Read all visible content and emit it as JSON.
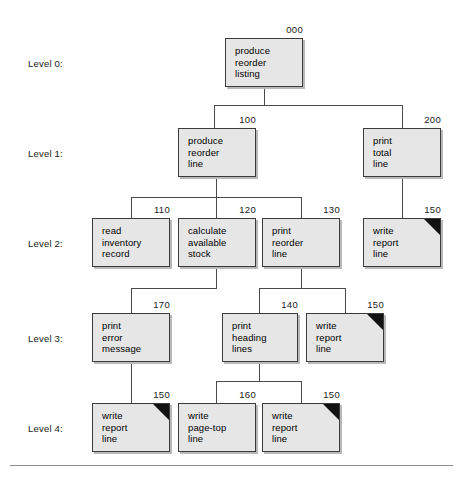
{
  "chart_data": {
    "type": "diagram",
    "level_labels": [
      {
        "text": "Level 0:",
        "x": 28,
        "y": 58
      },
      {
        "text": "Level 1:",
        "x": 28,
        "y": 148
      },
      {
        "text": "Level 2:",
        "x": 28,
        "y": 238
      },
      {
        "text": "Level 3:",
        "x": 28,
        "y": 333
      },
      {
        "text": "Level 4:",
        "x": 28,
        "y": 423
      }
    ],
    "nodes": [
      {
        "id": "n000",
        "num": "000",
        "label": "produce\nreorder\nlisting",
        "x": 225,
        "y": 38,
        "w": 78,
        "h": 49,
        "dup": false,
        "level": 0
      },
      {
        "id": "n100",
        "num": "100",
        "label": "produce\nreorder\nline",
        "x": 178,
        "y": 128,
        "w": 78,
        "h": 49,
        "dup": false,
        "level": 1
      },
      {
        "id": "n200",
        "num": "200",
        "label": "print\ntotal\nline",
        "x": 363,
        "y": 128,
        "w": 78,
        "h": 49,
        "dup": false,
        "level": 1
      },
      {
        "id": "n110",
        "num": "110",
        "label": "read\ninventory\nrecord",
        "x": 92,
        "y": 218,
        "w": 78,
        "h": 49,
        "dup": false,
        "level": 2
      },
      {
        "id": "n120",
        "num": "120",
        "label": "calculate\navailable\nstock",
        "x": 178,
        "y": 218,
        "w": 78,
        "h": 49,
        "dup": false,
        "level": 2
      },
      {
        "id": "n130",
        "num": "130",
        "label": "print\nreorder\nline",
        "x": 262,
        "y": 218,
        "w": 78,
        "h": 49,
        "dup": false,
        "level": 2
      },
      {
        "id": "n150a",
        "num": "150",
        "label": "write\nreport\nline",
        "x": 363,
        "y": 218,
        "w": 78,
        "h": 49,
        "dup": true,
        "level": 2
      },
      {
        "id": "n170",
        "num": "170",
        "label": "print\nerror\nmessage",
        "x": 92,
        "y": 313,
        "w": 78,
        "h": 49,
        "dup": false,
        "level": 3
      },
      {
        "id": "n140",
        "num": "140",
        "label": "print\nheading\nlines",
        "x": 222,
        "y": 313,
        "w": 76,
        "h": 49,
        "dup": false,
        "level": 3
      },
      {
        "id": "n150b",
        "num": "150",
        "label": "write\nreport\nline",
        "x": 306,
        "y": 313,
        "w": 78,
        "h": 49,
        "dup": true,
        "level": 3
      },
      {
        "id": "n150c",
        "num": "150",
        "label": "write\nreport\nline",
        "x": 92,
        "y": 403,
        "w": 78,
        "h": 49,
        "dup": true,
        "level": 4
      },
      {
        "id": "n160",
        "num": "160",
        "label": "write\npage-top\nline",
        "x": 178,
        "y": 403,
        "w": 78,
        "h": 49,
        "dup": false,
        "level": 4
      },
      {
        "id": "n150d",
        "num": "150",
        "label": "write\nreport\nline",
        "x": 262,
        "y": 403,
        "w": 78,
        "h": 49,
        "dup": true,
        "level": 4
      }
    ],
    "edges": [
      {
        "from": "n000",
        "to": "n100"
      },
      {
        "from": "n000",
        "to": "n200"
      },
      {
        "from": "n100",
        "to": "n110"
      },
      {
        "from": "n100",
        "to": "n120"
      },
      {
        "from": "n100",
        "to": "n130"
      },
      {
        "from": "n200",
        "to": "n150a"
      },
      {
        "from": "n120",
        "to": "n170"
      },
      {
        "from": "n130",
        "to": "n140"
      },
      {
        "from": "n130",
        "to": "n150b"
      },
      {
        "from": "n170",
        "to": "n150c"
      },
      {
        "from": "n140",
        "to": "n160"
      },
      {
        "from": "n140",
        "to": "n150d"
      }
    ],
    "segments": [
      {
        "o": "v",
        "x": 264,
        "y": 87,
        "len": 18
      },
      {
        "o": "h",
        "x": 214,
        "y": 105,
        "len": 189
      },
      {
        "o": "v",
        "x": 214,
        "y": 105,
        "len": 23
      },
      {
        "o": "v",
        "x": 402,
        "y": 105,
        "len": 23
      },
      {
        "o": "v",
        "x": 216,
        "y": 177,
        "len": 20
      },
      {
        "o": "h",
        "x": 131,
        "y": 197,
        "len": 171
      },
      {
        "o": "v",
        "x": 131,
        "y": 197,
        "len": 21
      },
      {
        "o": "v",
        "x": 216,
        "y": 197,
        "len": 21
      },
      {
        "o": "v",
        "x": 301,
        "y": 197,
        "len": 21
      },
      {
        "o": "v",
        "x": 402,
        "y": 177,
        "len": 41
      },
      {
        "o": "v",
        "x": 216,
        "y": 267,
        "len": 21
      },
      {
        "o": "h",
        "x": 131,
        "y": 288,
        "len": 86
      },
      {
        "o": "v",
        "x": 131,
        "y": 288,
        "len": 25
      },
      {
        "o": "v",
        "x": 301,
        "y": 267,
        "len": 21
      },
      {
        "o": "h",
        "x": 259,
        "y": 288,
        "len": 87
      },
      {
        "o": "v",
        "x": 259,
        "y": 288,
        "len": 25
      },
      {
        "o": "v",
        "x": 345,
        "y": 288,
        "len": 25
      },
      {
        "o": "v",
        "x": 131,
        "y": 362,
        "len": 41
      },
      {
        "o": "v",
        "x": 259,
        "y": 362,
        "len": 19
      },
      {
        "o": "h",
        "x": 216,
        "y": 381,
        "len": 86
      },
      {
        "o": "v",
        "x": 216,
        "y": 381,
        "len": 22
      },
      {
        "o": "v",
        "x": 301,
        "y": 381,
        "len": 22
      }
    ],
    "footer_rule": {
      "x": 10,
      "y": 465,
      "w": 443
    }
  }
}
